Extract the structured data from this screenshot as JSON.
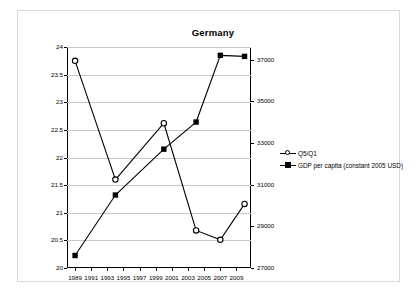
{
  "chart_data": {
    "type": "line",
    "title": "Germany",
    "xlabel": "",
    "ylabel": "",
    "grid": true,
    "legend_position": "right",
    "x_tick_labels": [
      "1989",
      "1991",
      "1993",
      "1995",
      "1997",
      "1999",
      "2001",
      "2003",
      "2005",
      "2007",
      "2009"
    ],
    "xlim": [
      1988,
      2010.8
    ],
    "left_axis": {
      "name": "Q5/Q1",
      "ylim": [
        20,
        24
      ],
      "ticks": [
        "20",
        "20.5",
        "21",
        "21.5",
        "22",
        "22.5",
        "23",
        "23.5",
        "24"
      ],
      "tick_values": [
        20,
        20.5,
        21,
        21.5,
        22,
        22.5,
        23,
        23.5,
        24
      ]
    },
    "right_axis": {
      "name": "GDP per capita (constant 2005 USD)",
      "ylim": [
        27000,
        37600
      ],
      "ticks": [
        "27000",
        "29000",
        "31000",
        "33000",
        "35000",
        "37000"
      ],
      "tick_values": [
        27000,
        29000,
        31000,
        33000,
        35000,
        37000
      ]
    },
    "series": [
      {
        "name": "Q5/Q1",
        "axis": "left",
        "marker": "open-circle",
        "x": [
          1989,
          1994,
          2000,
          2004,
          2007,
          2010
        ],
        "values": [
          23.75,
          21.6,
          22.62,
          20.68,
          20.51,
          21.16
        ]
      },
      {
        "name": "GDP per capita (constant 2005 USD)",
        "axis": "right",
        "marker": "filled-square",
        "x": [
          1989,
          1994,
          2000,
          2004,
          2007,
          2010
        ],
        "values": [
          27600,
          30500,
          32700,
          34000,
          37200,
          37150
        ]
      }
    ]
  },
  "legend": {
    "items": [
      {
        "label": "Q5/Q1",
        "marker": "open-circle"
      },
      {
        "label": "GDP per capita (constant 2005 USD)",
        "marker": "filled-square"
      }
    ]
  }
}
